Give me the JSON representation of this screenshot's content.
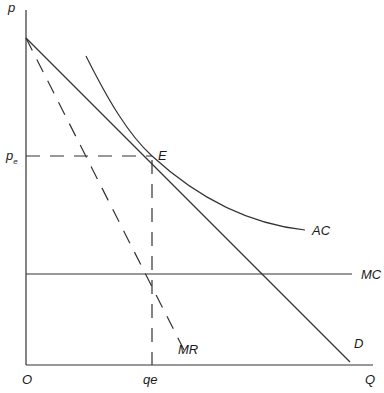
{
  "diagram": {
    "type": "economics-monopolistic-competition-equilibrium",
    "axes": {
      "y_label": "p",
      "x_label": "Q",
      "origin_label": "O"
    },
    "points": {
      "equilibrium_label": "E",
      "price_label": "p",
      "price_subscript": "e",
      "quantity_label": "qe"
    },
    "curves": {
      "demand": "D",
      "marginal_revenue": "MR",
      "average_cost": "AC",
      "marginal_cost": "MC"
    },
    "colors": {
      "line": "#333333",
      "text": "#1a1a1a",
      "background": "#ffffff"
    }
  }
}
